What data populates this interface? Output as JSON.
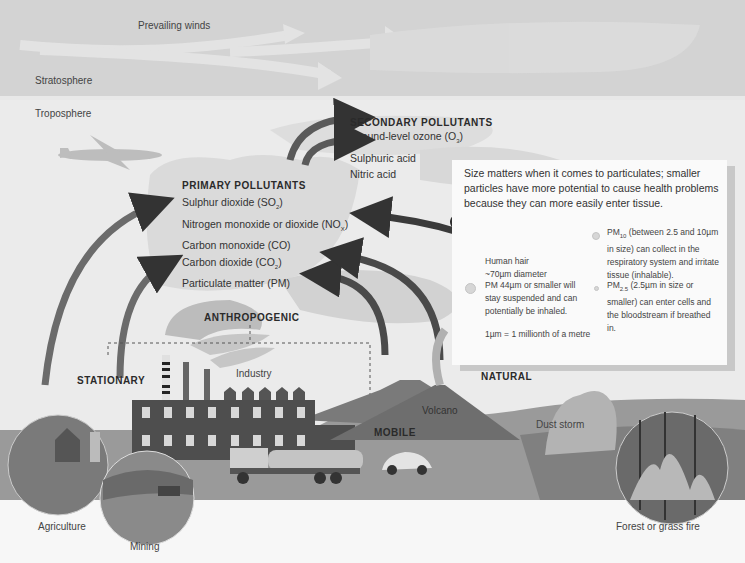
{
  "atmosphere": {
    "stratosphere_label": "Stratosphere",
    "troposphere_label": "Troposphere",
    "winds_label": "Prevailing winds"
  },
  "secondary": {
    "title": "SECONDARY POLLUTANTS",
    "items": [
      "Ground-level ozone (O",
      "Sulphuric acid",
      "Nitric acid"
    ],
    "ozone_sub": "3",
    "ozone_close": ")"
  },
  "primary": {
    "title": "PRIMARY POLLUTANTS",
    "items": [
      {
        "text": "Sulphur dioxide (SO",
        "sub": "2",
        "close": ")"
      },
      {
        "text": "Nitrogen monoxide or dioxide (NO",
        "sub": "X",
        "close": ")"
      },
      {
        "text": "Carbon monoxide (CO)",
        "sub": "",
        "close": ""
      },
      {
        "text": "Carbon dioxide (CO",
        "sub": "2",
        "close": ")"
      },
      {
        "text": "Particulate matter (PM)",
        "sub": "",
        "close": ""
      }
    ]
  },
  "particulates": {
    "intro": "Size matters when it comes to particulates; smaller particles have more potential to cause health problems because they can more easily enter tissue.",
    "hair_label_1": "Human hair",
    "hair_label_2": "~70µm diameter",
    "pm44": "PM 44µm or smaller will stay suspended and can potentially be inhaled.",
    "unit_note": "1µm = 1 millionth of a metre",
    "pm10_prefix": "PM",
    "pm10_sub": "10",
    "pm10_text": " (between 2.5 and 10µm in size) can collect in the respiratory system and irritate tissue (inhalable).",
    "pm25_prefix": "PM",
    "pm25_sub": "2.5",
    "pm25_text": " (2.5µm in size or smaller) can enter cells and the bloodstream if breathed in."
  },
  "sources": {
    "anthropogenic": "ANTHROPOGENIC",
    "stationary": "STATIONARY",
    "mobile": "MOBILE",
    "natural": "NATURAL",
    "industry": "Industry",
    "volcano": "Volcano",
    "dust_storm": "Dust storm",
    "agriculture": "Agriculture",
    "mining": "Mining",
    "forest_fire": "Forest or grass fire"
  },
  "colors": {
    "stratosphere": "#d3d3d3",
    "troposphere": "#ebebeb",
    "arrow": "#3a3a3a",
    "factory": "#4a4a4a",
    "ground": "#8a8a8a"
  }
}
